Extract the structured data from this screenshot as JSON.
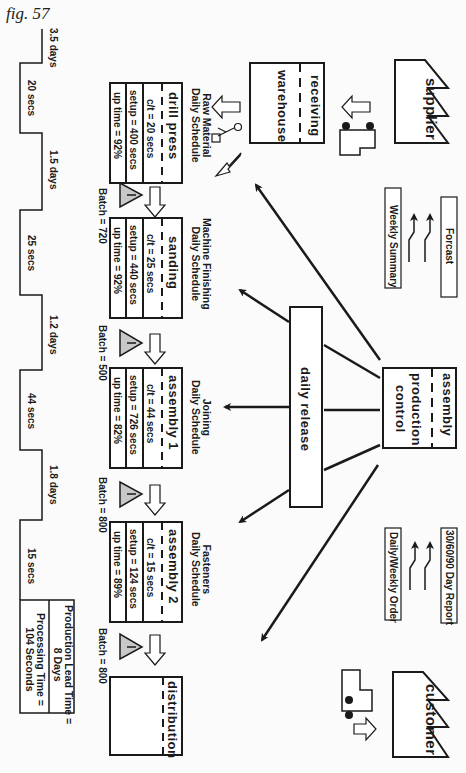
{
  "figure_label": "fig. 57",
  "entities": {
    "supplier": "supplier",
    "customer": "customer",
    "production_control": [
      "assembly",
      "production",
      "control"
    ],
    "warehouse": {
      "top": "receiving",
      "bottom": "warehouse"
    },
    "distribution": "distribution",
    "daily_release": "daily release"
  },
  "info_flows": {
    "forecast": "Forcast",
    "weekly_summary": "Weekly Summary",
    "day_report": "30/60/90 Day Report",
    "daily_weekly_order": "Daily/Weekly Order"
  },
  "processes": [
    {
      "name": "drill press",
      "schedule": [
        "Raw Material",
        "Daily Schedule"
      ],
      "ct": "c/t = 20 secs",
      "setup": "setup = 400 secs",
      "uptime": "up time = 92%",
      "batch": "Batch = 720"
    },
    {
      "name": "sanding",
      "schedule": [
        "Machine Finishing",
        "Daily Schedule"
      ],
      "ct": "c/t = 25 secs",
      "setup": "setup = 440 secs",
      "uptime": "up time = 92%",
      "batch": "Batch = 500"
    },
    {
      "name": "assembly 1",
      "schedule": [
        "Joining",
        "Daily Schedule"
      ],
      "ct": "c/t = 44 secs",
      "setup": "setup = 726 secs",
      "uptime": "up time = 82%",
      "batch": "Batch = 800"
    },
    {
      "name": "assembly 2",
      "schedule": [
        "Fasteners",
        "Daily Schedule"
      ],
      "ct": "c/t = 15 secs",
      "setup": "setup = 124 secs",
      "uptime": "up time = 89%",
      "batch": "Batch = 800"
    }
  ],
  "timeline": {
    "wait": [
      "3.5 days",
      "1.5 days",
      "1.2 days",
      "1.8 days"
    ],
    "process": [
      "20 secs",
      "25 secs",
      "44 secs",
      "15 secs"
    ],
    "summary": {
      "lead_time": [
        "Production Lead Time =",
        "8 Days"
      ],
      "processing_time": [
        "Processing Time =",
        "104 Seconds"
      ]
    }
  },
  "inventory_symbol": "I",
  "colors": {
    "line": "#1a1a1a",
    "triangle_fill": "#c8c8c8",
    "background": "#fbfbfb"
  }
}
